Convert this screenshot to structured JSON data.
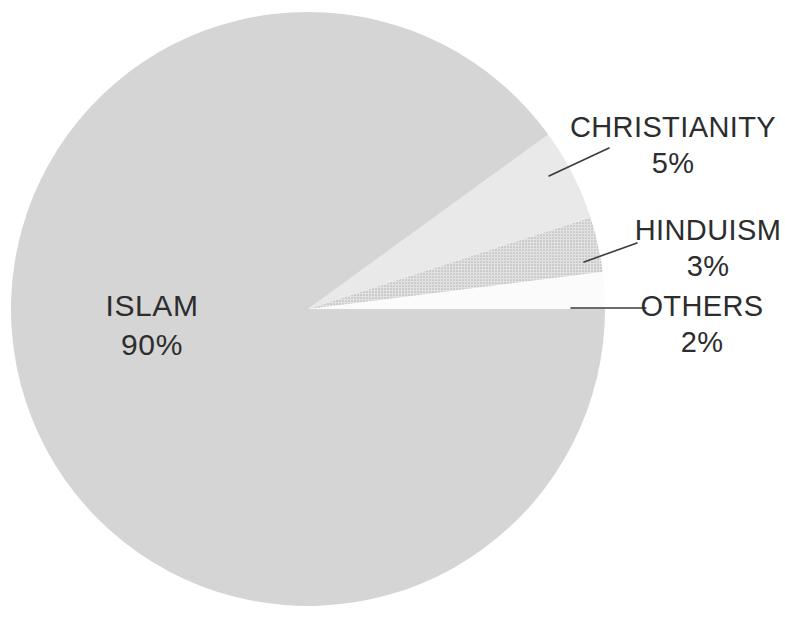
{
  "chart_data": {
    "type": "pie",
    "title": "",
    "subtitle": "",
    "xlabel": "",
    "ylabel": "",
    "legend_position": "none",
    "grid": false,
    "units": "percent",
    "start_angle_deg": 0,
    "direction": "counterclockwise",
    "categories": [
      "ISLAM",
      "CHRISTIANITY",
      "HINDUISM",
      "OTHERS"
    ],
    "values": [
      90,
      3,
      5,
      2
    ],
    "slices": [
      {
        "label": "ISLAM",
        "value": 90,
        "value_text": "90%",
        "color": "#d5d5d5",
        "fill_style": "solid",
        "label_placement": "inside",
        "label_x": 152,
        "label_y": 316,
        "value_x": 152,
        "value_y": 355
      },
      {
        "label": "CHRISTIANITY",
        "value": 5,
        "value_text": "5%",
        "color": "#e9e9e9",
        "fill_style": "solid",
        "label_placement": "outside",
        "label_x": 673,
        "label_y": 137,
        "value_x": 673,
        "value_y": 173,
        "leader": {
          "x1": 549,
          "y1": 176,
          "x2": 609,
          "y2": 148
        }
      },
      {
        "label": "HINDUISM",
        "value": 3,
        "value_text": "3%",
        "color": "#d0d0d0",
        "fill_style": "dotted-halftone",
        "label_placement": "outside",
        "label_x": 708,
        "label_y": 240,
        "value_x": 708,
        "value_y": 276,
        "leader": {
          "x1": 584,
          "y1": 262,
          "x2": 637,
          "y2": 243
        }
      },
      {
        "label": "OTHERS",
        "value": 2,
        "value_text": "2%",
        "color": "#fbfbfb",
        "fill_style": "solid",
        "label_placement": "outside",
        "label_x": 702,
        "label_y": 316,
        "value_x": 702,
        "value_y": 352,
        "leader": {
          "x1": 571,
          "y1": 308,
          "x2": 646,
          "y2": 308
        }
      }
    ],
    "geometry": {
      "center_x": 308,
      "center_y": 309,
      "radius": 297
    },
    "colors": {
      "background": "#ffffff",
      "islam": "#d5d5d5",
      "christianity": "#e9e9e9",
      "hinduism": "#d0d0d0",
      "others": "#fbfbfb",
      "text": "#2d2d2d",
      "leader_line": "#3b3b3b"
    }
  }
}
